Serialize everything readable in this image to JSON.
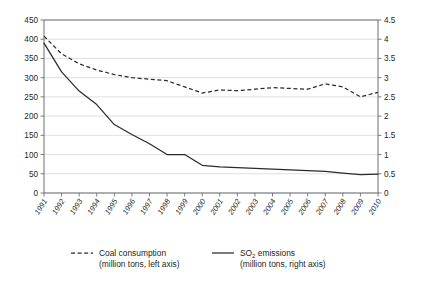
{
  "chart_data": {
    "type": "line",
    "title": "",
    "subtitle": "",
    "xlabel": "",
    "ylabel": "",
    "grid": true,
    "legend_position": "bottom",
    "x": [
      "1991",
      "1992",
      "1993",
      "1994",
      "1995",
      "1996",
      "1997",
      "1998",
      "1999",
      "2000",
      "2001",
      "2002",
      "2003",
      "2004",
      "2005",
      "2006",
      "2007",
      "2008",
      "2009",
      "2010"
    ],
    "categories": [
      "1991",
      "1992",
      "1993",
      "1994",
      "1995",
      "1996",
      "1997",
      "1998",
      "1999",
      "2000",
      "2001",
      "2002",
      "2003",
      "2004",
      "2005",
      "2006",
      "2007",
      "2008",
      "2009",
      "2010"
    ],
    "axes": {
      "left": {
        "label": "million tons, left axis",
        "min": 0,
        "max": 450,
        "step": 50,
        "ticks": [
          "0",
          "50",
          "100",
          "150",
          "200",
          "250",
          "300",
          "350",
          "400",
          "450"
        ]
      },
      "right": {
        "label": "million tons, right axis",
        "min": 0,
        "max": 4.5,
        "step": 0.5,
        "ticks": [
          "0",
          "0.5",
          "1",
          "1.5",
          "2",
          "2.5",
          "3",
          "3.5",
          "4",
          "4.5"
        ]
      }
    },
    "series": [
      {
        "name": "Coal consumption",
        "axis": "left",
        "style": "dashed",
        "unit": "million tons",
        "values": [
          408,
          362,
          336,
          320,
          308,
          300,
          296,
          292,
          276,
          260,
          268,
          266,
          270,
          274,
          272,
          270,
          284,
          276,
          250,
          262
        ]
      },
      {
        "name": "SO2 emissions",
        "axis": "right",
        "style": "solid",
        "unit": "million tons",
        "values": [
          3.9,
          3.15,
          2.65,
          2.3,
          1.78,
          1.52,
          1.28,
          1.0,
          1.0,
          0.72,
          0.68,
          0.66,
          0.64,
          0.62,
          0.6,
          0.58,
          0.56,
          0.52,
          0.48,
          0.49
        ]
      }
    ]
  },
  "legend": {
    "items": [
      {
        "label": "Coal consumption",
        "sublabel": "(million tons, left axis)",
        "style": "dashed"
      },
      {
        "label_prefix": "SO",
        "label_sub": "2",
        "label_suffix": " emissions",
        "label": "SO2 emissions",
        "sublabel": "(million tons, right axis)",
        "style": "solid"
      }
    ]
  },
  "colors": {
    "line": "#2b2b2b",
    "axis": "#6d6e71",
    "grid": "#d6d7d9",
    "text": "#231f20",
    "background": "#ffffff"
  }
}
